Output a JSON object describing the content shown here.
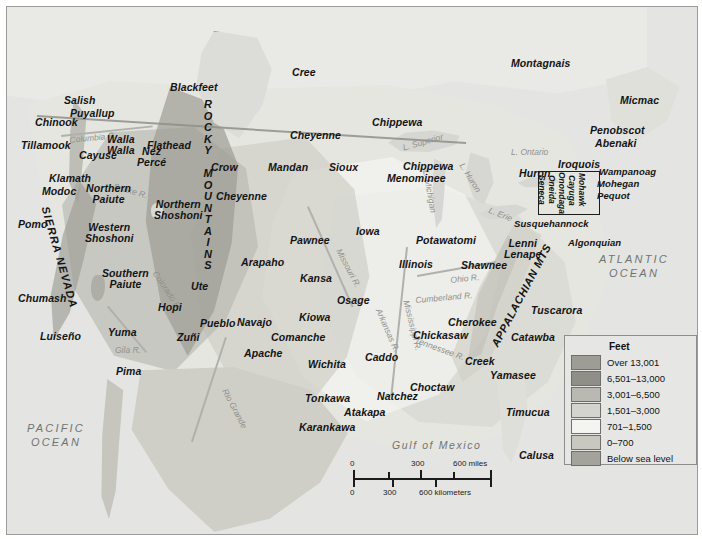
{
  "map": {
    "title": "Native American Peoples of North America",
    "oceans": [
      {
        "name": "pacific-ocean",
        "text": "PACIFIC\nOCEAN",
        "line1": "PACIFIC",
        "line2": "OCEAN",
        "x": 20,
        "y": 415
      },
      {
        "name": "atlantic-ocean",
        "text": "ATLANTIC\nOCEAN",
        "line1": "ATLANTIC",
        "line2": "OCEAN",
        "x": 592,
        "y": 246
      },
      {
        "name": "gulf-of-mexico",
        "text": "Gulf of Mexico",
        "x": 385,
        "y": 432
      }
    ],
    "mountain_ranges": [
      {
        "name": "rocky-mountains",
        "label": "ROCKY MOUNTAINS",
        "letters": [
          "R",
          "O",
          "C",
          "K",
          "Y",
          "",
          "M",
          "O",
          "U",
          "N",
          "T",
          "A",
          "I",
          "N",
          "S"
        ]
      },
      {
        "name": "sierra-nevada",
        "label": "SIERRA NEVADA"
      },
      {
        "name": "appalachian-mts",
        "label": "APPALACHIAN MTS"
      }
    ],
    "water_features": [
      {
        "name": "lake-superior",
        "label": "L. Superior"
      },
      {
        "name": "lake-michigan",
        "label": "L. Michigan"
      },
      {
        "name": "lake-huron",
        "label": "L. Huron"
      },
      {
        "name": "lake-erie",
        "label": "L. Erie"
      },
      {
        "name": "lake-ontario",
        "label": "L. Ontario"
      },
      {
        "name": "columbia-river",
        "label": "Columbia R."
      },
      {
        "name": "snake-river",
        "label": "Snake R."
      },
      {
        "name": "colorado-river",
        "label": "Colorado R."
      },
      {
        "name": "gila-river",
        "label": "Gila R."
      },
      {
        "name": "rio-grande",
        "label": "Rio Grande"
      },
      {
        "name": "missouri-river",
        "label": "Missouri R."
      },
      {
        "name": "mississippi-river",
        "label": "Mississippi R."
      },
      {
        "name": "ohio-river",
        "label": "Ohio R."
      },
      {
        "name": "cumberland-river",
        "label": "Cumberland R."
      },
      {
        "name": "tennessee-river",
        "label": "Tennessee R."
      },
      {
        "name": "arkansas-river",
        "label": "Arkansas R."
      }
    ],
    "tribes": [
      {
        "name": "salish",
        "label": "Salish",
        "x": 57,
        "y": 88
      },
      {
        "name": "chinook",
        "label": "Chinook",
        "x": 28,
        "y": 110
      },
      {
        "name": "puyallup",
        "label": "Puyallup",
        "x": 63,
        "y": 101
      },
      {
        "name": "tillamook",
        "label": "Tillamook",
        "x": 14,
        "y": 133
      },
      {
        "name": "cayuse",
        "label": "Cayuse",
        "x": 72,
        "y": 143
      },
      {
        "name": "walla-walla",
        "label": "Walla\nWalla",
        "line1": "Walla",
        "line2": "Walla",
        "x": 100,
        "y": 127
      },
      {
        "name": "nez-perce",
        "label": "Nez\nPercé",
        "line1": "Nez",
        "line2": "Percé",
        "x": 130,
        "y": 139
      },
      {
        "name": "flathead",
        "label": "Flathead",
        "x": 140,
        "y": 133
      },
      {
        "name": "blackfeet",
        "label": "Blackfeet",
        "x": 163,
        "y": 75
      },
      {
        "name": "klamath",
        "label": "Klamath",
        "x": 42,
        "y": 166
      },
      {
        "name": "modoc",
        "label": "Modoc",
        "x": 35,
        "y": 179
      },
      {
        "name": "northern-paiute",
        "label": "Northern\nPaiute",
        "line1": "Northern",
        "line2": "Paiute",
        "x": 79,
        "y": 176
      },
      {
        "name": "northern-shoshoni",
        "label": "Northern\nShoshoni",
        "line1": "Northern",
        "line2": "Shoshoni",
        "x": 147,
        "y": 192
      },
      {
        "name": "crow",
        "label": "Crow",
        "x": 204,
        "y": 155
      },
      {
        "name": "cheyenne-north",
        "label": "Cheyenne",
        "x": 283,
        "y": 123
      },
      {
        "name": "cheyenne-south",
        "label": "Cheyenne",
        "x": 209,
        "y": 184
      },
      {
        "name": "mandan",
        "label": "Mandan",
        "x": 261,
        "y": 155
      },
      {
        "name": "sioux",
        "label": "Sioux",
        "x": 322,
        "y": 155
      },
      {
        "name": "pomo",
        "label": "Pomo",
        "x": 11,
        "y": 212
      },
      {
        "name": "western-shoshoni",
        "label": "Western\nShoshoni",
        "line1": "Western",
        "line2": "Shoshoni",
        "x": 78,
        "y": 215
      },
      {
        "name": "chumash",
        "label": "Chumash",
        "x": 11,
        "y": 286
      },
      {
        "name": "southern-paiute",
        "label": "Southern\nPaiute",
        "line1": "Southern",
        "line2": "Paiute",
        "x": 95,
        "y": 261
      },
      {
        "name": "luiseno",
        "label": "Luiseño",
        "x": 33,
        "y": 324
      },
      {
        "name": "yuma",
        "label": "Yuma",
        "x": 101,
        "y": 320
      },
      {
        "name": "pima",
        "label": "Pima",
        "x": 109,
        "y": 359
      },
      {
        "name": "ute",
        "label": "Ute",
        "x": 184,
        "y": 274
      },
      {
        "name": "hopi",
        "label": "Hopi",
        "x": 151,
        "y": 295
      },
      {
        "name": "zuni",
        "label": "Zuñi",
        "x": 170,
        "y": 325
      },
      {
        "name": "pueblo",
        "label": "Pueblo",
        "x": 193,
        "y": 311
      },
      {
        "name": "navajo",
        "label": "Navajo",
        "x": 230,
        "y": 310
      },
      {
        "name": "apache",
        "label": "Apache",
        "x": 237,
        "y": 341
      },
      {
        "name": "arapaho",
        "label": "Arapaho",
        "x": 234,
        "y": 250
      },
      {
        "name": "pawnee",
        "label": "Pawnee",
        "x": 283,
        "y": 228
      },
      {
        "name": "kansa",
        "label": "Kansa",
        "x": 293,
        "y": 266
      },
      {
        "name": "osage",
        "label": "Osage",
        "x": 330,
        "y": 288
      },
      {
        "name": "kiowa",
        "label": "Kiowa",
        "x": 292,
        "y": 305
      },
      {
        "name": "comanche",
        "label": "Comanche",
        "x": 264,
        "y": 325
      },
      {
        "name": "wichita",
        "label": "Wichita",
        "x": 301,
        "y": 352
      },
      {
        "name": "caddo",
        "label": "Caddo",
        "x": 358,
        "y": 345
      },
      {
        "name": "tonkawa",
        "label": "Tonkawa",
        "x": 298,
        "y": 386
      },
      {
        "name": "atakapa",
        "label": "Atakapa",
        "x": 337,
        "y": 400
      },
      {
        "name": "karankawa",
        "label": "Karankawa",
        "x": 292,
        "y": 415
      },
      {
        "name": "natchez",
        "label": "Natchez",
        "x": 370,
        "y": 384
      },
      {
        "name": "choctaw",
        "label": "Choctaw",
        "x": 403,
        "y": 375
      },
      {
        "name": "iowa",
        "label": "Iowa",
        "x": 349,
        "y": 219
      },
      {
        "name": "illinois",
        "label": "Illinois",
        "x": 392,
        "y": 252
      },
      {
        "name": "potawatomi",
        "label": "Potawatomi",
        "x": 409,
        "y": 228
      },
      {
        "name": "chippewa-north",
        "label": "Chippewa",
        "x": 365,
        "y": 110
      },
      {
        "name": "chippewa-south",
        "label": "Chippewa",
        "x": 396,
        "y": 154
      },
      {
        "name": "menominee",
        "label": "Menominee",
        "x": 380,
        "y": 166
      },
      {
        "name": "shawnee",
        "label": "Shawnee",
        "x": 454,
        "y": 253
      },
      {
        "name": "cherokee",
        "label": "Cherokee",
        "x": 441,
        "y": 310
      },
      {
        "name": "chickasaw",
        "label": "Chickasaw",
        "x": 406,
        "y": 323
      },
      {
        "name": "creek",
        "label": "Creek",
        "x": 458,
        "y": 349
      },
      {
        "name": "yamasee",
        "label": "Yamasee",
        "x": 483,
        "y": 363
      },
      {
        "name": "catawba",
        "label": "Catawba",
        "x": 504,
        "y": 325
      },
      {
        "name": "tuscarora",
        "label": "Tuscarora",
        "x": 524,
        "y": 298
      },
      {
        "name": "timucua",
        "label": "Timucua",
        "x": 499,
        "y": 400
      },
      {
        "name": "calusa",
        "label": "Calusa",
        "x": 512,
        "y": 443
      },
      {
        "name": "lenni-lenape",
        "label": "Lenni\nLenape",
        "line1": "Lenni",
        "line2": "Lenape",
        "x": 497,
        "y": 231
      },
      {
        "name": "susquehannock",
        "label": "Susquehannock",
        "x": 507,
        "y": 212
      },
      {
        "name": "algonquian",
        "label": "Algonquian",
        "x": 561,
        "y": 231
      },
      {
        "name": "iroquois",
        "label": "Iroquois",
        "x": 551,
        "y": 152
      },
      {
        "name": "huron",
        "label": "Huron",
        "x": 512,
        "y": 161
      },
      {
        "name": "wampanoag",
        "label": "Wampanoag",
        "x": 592,
        "y": 160
      },
      {
        "name": "mohegan",
        "label": "Mohegan",
        "x": 590,
        "y": 172
      },
      {
        "name": "pequot",
        "label": "Pequot",
        "x": 590,
        "y": 184
      },
      {
        "name": "penobscot",
        "label": "Penobscot",
        "x": 583,
        "y": 118
      },
      {
        "name": "abenaki",
        "label": "Abenaki",
        "x": 588,
        "y": 131
      },
      {
        "name": "micmac",
        "label": "Micmac",
        "x": 613,
        "y": 88
      },
      {
        "name": "montagnais",
        "label": "Montagnais",
        "x": 504,
        "y": 51
      },
      {
        "name": "cree",
        "label": "Cree",
        "x": 285,
        "y": 60
      }
    ],
    "iroquois_nations": [
      {
        "name": "seneca",
        "label": "Seneca",
        "x": 538
      },
      {
        "name": "oneida",
        "label": "Oneida",
        "x": 548
      },
      {
        "name": "onondaga",
        "label": "Onondaga",
        "x": 558
      },
      {
        "name": "cayuga",
        "label": "Cayuga",
        "x": 568
      },
      {
        "name": "mohawk",
        "label": "Mohawk",
        "x": 578
      }
    ],
    "legend": {
      "title": "Feet",
      "entries": [
        {
          "name": "legend-over-13001",
          "label": "Over 13,001",
          "color": "#9d9d95"
        },
        {
          "name": "legend-6501-13000",
          "label": "6,501–13,000",
          "color": "#8f8f87"
        },
        {
          "name": "legend-3001-6500",
          "label": "3,001–6,500",
          "color": "#b9b9b1"
        },
        {
          "name": "legend-1501-3000",
          "label": "1,501–3,000",
          "color": "#d4d4ce"
        },
        {
          "name": "legend-701-1500",
          "label": "701–1,500",
          "color": "#f4f4f0"
        },
        {
          "name": "legend-0-700",
          "label": "0–700",
          "color": "#c8c8c1"
        },
        {
          "name": "legend-below-sea-level",
          "label": "Below sea level",
          "color": "#a3a39b"
        }
      ]
    },
    "scalebar": {
      "miles": {
        "ticks": [
          "0",
          "300",
          "600 miles"
        ],
        "unit": "miles"
      },
      "kilometers": {
        "ticks": [
          "0",
          "300",
          "600 kilometers"
        ],
        "unit": "kilometers"
      }
    }
  }
}
